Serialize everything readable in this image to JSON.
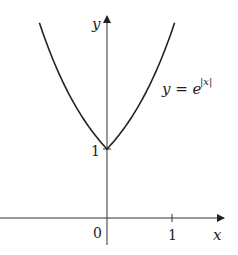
{
  "chart_data": {
    "type": "line",
    "title": "",
    "xlabel": "x",
    "ylabel": "y",
    "series": [
      {
        "name": "y = e^|x|",
        "function": "exp(abs(x))",
        "x": [
          -1.04,
          -0.75,
          -0.5,
          -0.25,
          0,
          0.25,
          0.5,
          0.75,
          1.04
        ],
        "values": [
          2.83,
          2.12,
          1.65,
          1.28,
          1.0,
          1.28,
          1.65,
          2.12,
          2.83
        ]
      }
    ],
    "x_ticks": [
      {
        "value": 0,
        "label": "0"
      },
      {
        "value": 1,
        "label": "1"
      }
    ],
    "y_ticks": [
      {
        "value": 1,
        "label": "1"
      }
    ],
    "annotations": [
      {
        "text": "y = e^|x|",
        "position": "right of curve"
      }
    ],
    "xlim": [
      -1.65,
      1.8
    ],
    "ylim": [
      -0.4,
      2.9
    ],
    "grid": false,
    "legend": "none"
  },
  "labels": {
    "y_axis": "y",
    "x_axis": "x",
    "origin": "0",
    "x_tick_1": "1",
    "y_tick_1": "1",
    "curve_label_base": "y = e",
    "curve_label_exp": "|x|"
  }
}
